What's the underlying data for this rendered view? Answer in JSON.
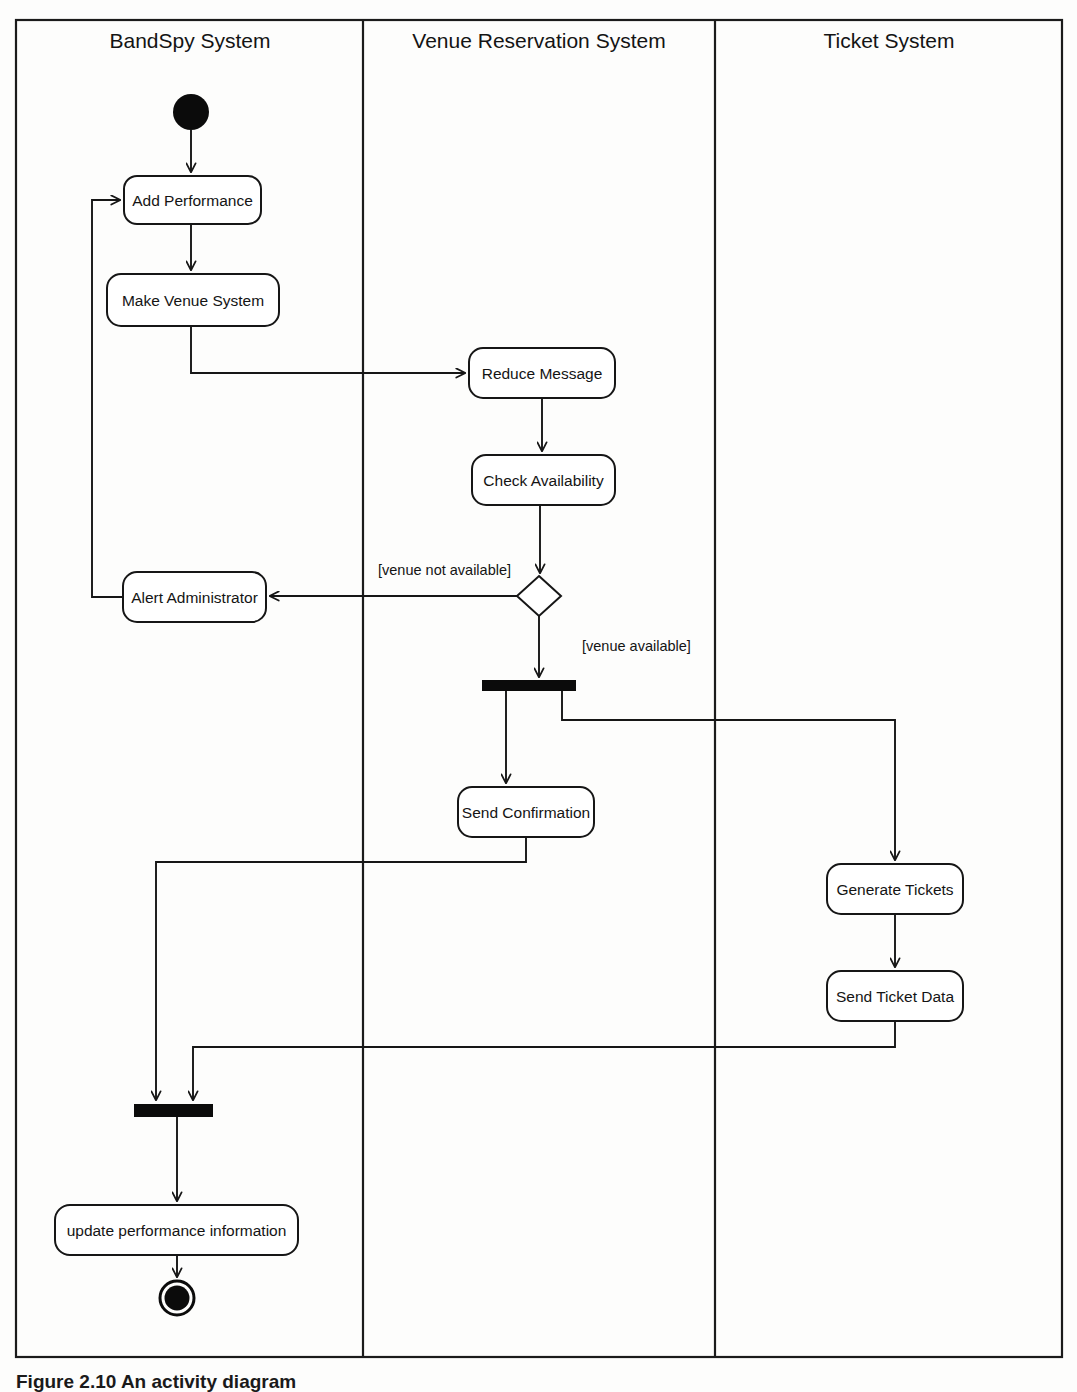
{
  "diagram": {
    "kind": "uml-activity-diagram",
    "caption": "Figure 2.10  An activity diagram",
    "frame": {
      "x": 16,
      "y": 20,
      "width": 1046,
      "height": 1337
    },
    "lanes": [
      {
        "id": "bandspy",
        "title": "BandSpy System",
        "x": 16,
        "width": 347,
        "title_x": 190,
        "title_y": 48
      },
      {
        "id": "venue",
        "title": "Venue Reservation System",
        "x": 363,
        "width": 352,
        "title_x": 539,
        "title_y": 48
      },
      {
        "id": "ticket",
        "title": "Ticket System",
        "x": 715,
        "width": 347,
        "title_x": 889,
        "title_y": 48
      }
    ],
    "lane_divider_x": [
      363,
      715
    ],
    "nodes": [
      {
        "id": "start",
        "type": "initial-node",
        "lane": "bandspy",
        "cx": 191,
        "cy": 112,
        "rx": 18,
        "ry": 18,
        "label": ""
      },
      {
        "id": "add-performance",
        "type": "action",
        "lane": "bandspy",
        "x": 124,
        "y": 176,
        "width": 137,
        "height": 48,
        "label": "Add Performance"
      },
      {
        "id": "make-venue",
        "type": "action",
        "lane": "bandspy",
        "x": 107,
        "y": 274,
        "width": 172,
        "height": 52,
        "label": "Make Venue System"
      },
      {
        "id": "reduce-message",
        "type": "action",
        "lane": "venue",
        "x": 469,
        "y": 348,
        "width": 146,
        "height": 50,
        "label": "Reduce Message"
      },
      {
        "id": "check-availability",
        "type": "action",
        "lane": "venue",
        "x": 472,
        "y": 455,
        "width": 143,
        "height": 50,
        "label": "Check Availability"
      },
      {
        "id": "decision",
        "type": "decision",
        "lane": "venue",
        "cx": 539,
        "cy": 596,
        "half_w": 22,
        "half_h": 20,
        "label": ""
      },
      {
        "id": "alert-admin",
        "type": "action",
        "lane": "bandspy",
        "x": 123,
        "y": 572,
        "width": 143,
        "height": 50,
        "label": "Alert Administrator"
      },
      {
        "id": "fork",
        "type": "fork-bar",
        "lane": "venue",
        "x": 482,
        "y": 680,
        "width": 94,
        "height": 11,
        "label": ""
      },
      {
        "id": "send-confirmation",
        "type": "action",
        "lane": "venue",
        "x": 458,
        "y": 787,
        "width": 136,
        "height": 50,
        "label": "Send Confirmation"
      },
      {
        "id": "generate-tickets",
        "type": "action",
        "lane": "ticket",
        "x": 827,
        "y": 864,
        "width": 136,
        "height": 50,
        "label": "Generate Tickets"
      },
      {
        "id": "send-ticket-data",
        "type": "action",
        "lane": "ticket",
        "x": 827,
        "y": 971,
        "width": 136,
        "height": 50,
        "label": "Send Ticket Data"
      },
      {
        "id": "join",
        "type": "join-bar",
        "lane": "bandspy",
        "x": 134,
        "y": 1104,
        "width": 79,
        "height": 13,
        "label": ""
      },
      {
        "id": "update-performance",
        "type": "action",
        "lane": "bandspy",
        "x": 55,
        "y": 1205,
        "width": 243,
        "height": 50,
        "label": "update performance information"
      },
      {
        "id": "end",
        "type": "final-node",
        "lane": "bandspy",
        "cx": 177,
        "cy": 1298,
        "r_outer": 18,
        "r_inner": 12,
        "label": ""
      }
    ],
    "guards": [
      {
        "id": "guard-not-available",
        "text": "[venue not available]",
        "x": 378,
        "y": 575
      },
      {
        "id": "guard-available",
        "text": "[venue available]",
        "x": 582,
        "y": 646
      }
    ],
    "edges": [
      {
        "id": "e-start-add",
        "from": "start",
        "to": "add-performance",
        "path": "M 191 130 L 191 176"
      },
      {
        "id": "e-add-make",
        "from": "add-performance",
        "to": "make-venue",
        "path": "M 191 224 L 191 274"
      },
      {
        "id": "e-make-reduce",
        "from": "make-venue",
        "to": "reduce-message",
        "path": "M 191 326 L 191 373 L 469 373"
      },
      {
        "id": "e-reduce-check",
        "from": "reduce-message",
        "to": "check-availability",
        "path": "M 542 398 L 542 455"
      },
      {
        "id": "e-check-decision",
        "from": "check-availability",
        "to": "decision",
        "path": "M 540 505 L 540 576"
      },
      {
        "id": "e-decision-alert",
        "from": "decision",
        "to": "alert-admin",
        "path": "M 517 596 L 266 596"
      },
      {
        "id": "e-alert-loop-add",
        "from": "alert-admin",
        "to": "add-performance",
        "path": "M 123 597 L 92 597 L 92 200 L 124 200"
      },
      {
        "id": "e-decision-fork",
        "from": "decision",
        "to": "fork",
        "path": "M 539 616 L 539 680"
      },
      {
        "id": "e-fork-send-conf",
        "from": "fork",
        "to": "send-confirmation",
        "path": "M 506 691 L 506 787"
      },
      {
        "id": "e-fork-generate",
        "from": "fork",
        "to": "generate-tickets",
        "path": "M 562 691 L 562 720 L 895 720 L 895 864"
      },
      {
        "id": "e-generate-send-data",
        "from": "generate-tickets",
        "to": "send-ticket-data",
        "path": "M 895 914 L 895 971"
      },
      {
        "id": "e-send-conf-join",
        "from": "send-confirmation",
        "to": "join",
        "path": "M 526 837 L 526 862 L 156 862 L 156 1104"
      },
      {
        "id": "e-send-data-join",
        "from": "send-ticket-data",
        "to": "join",
        "path": "M 895 1021 L 895 1047 L 193 1047 L 193 1104"
      },
      {
        "id": "e-join-update",
        "from": "join",
        "to": "update-performance",
        "path": "M 177 1117 L 177 1205"
      },
      {
        "id": "e-update-end",
        "from": "update-performance",
        "to": "end",
        "path": "M 177 1255 L 177 1280"
      }
    ]
  }
}
